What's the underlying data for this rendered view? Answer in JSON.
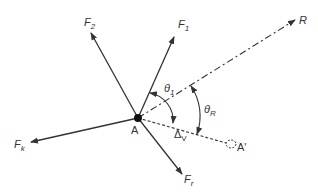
{
  "diagram": {
    "type": "force-vector-diagram",
    "origin_point": "A",
    "vectors": [
      {
        "name": "F2",
        "label": "F",
        "subscript": "2",
        "style": "solid"
      },
      {
        "name": "F1",
        "label": "F",
        "subscript": "1",
        "style": "solid"
      },
      {
        "name": "R",
        "label": "R",
        "subscript": "",
        "style": "dash-dot"
      },
      {
        "name": "Fk",
        "label": "F",
        "subscript": "k",
        "style": "solid"
      },
      {
        "name": "Fr",
        "label": "F",
        "subscript": "r",
        "style": "solid"
      }
    ],
    "reference_line": {
      "name": "A-A'",
      "style": "dashed"
    },
    "angles": [
      {
        "name": "theta1",
        "label": "θ",
        "subscript": "1"
      },
      {
        "name": "thetaR",
        "label": "θ",
        "subscript": "R"
      }
    ],
    "points": [
      {
        "name": "A",
        "label": "A"
      },
      {
        "name": "A-prime",
        "label": "A'"
      }
    ],
    "delta_label": {
      "label": "Δ",
      "subscript": "V"
    },
    "colors": {
      "line": "#333333",
      "background": "#ffffff"
    }
  }
}
